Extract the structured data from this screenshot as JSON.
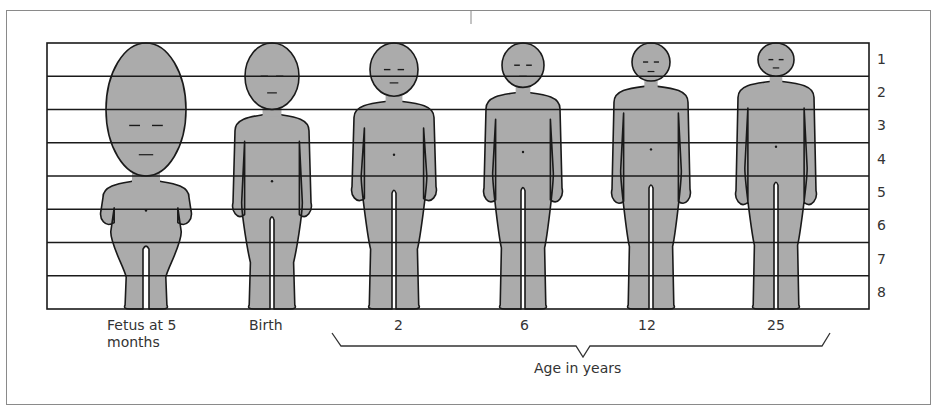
{
  "figure": {
    "grid_divisions": 8,
    "scale_labels": [
      "1",
      "2",
      "3",
      "4",
      "5",
      "6",
      "7",
      "8"
    ],
    "fill_color": "#ababab",
    "outline_color": "#1a1a1a",
    "stages": [
      {
        "id": "fetus",
        "label": "Fetus at 5",
        "label_line2": "months",
        "head_fraction": 0.5
      },
      {
        "id": "birth",
        "label": "Birth",
        "head_fraction": 0.25
      },
      {
        "id": "age2",
        "label": "2",
        "head_fraction": 0.2
      },
      {
        "id": "age6",
        "label": "6",
        "head_fraction": 0.167
      },
      {
        "id": "age12",
        "label": "12",
        "head_fraction": 0.143
      },
      {
        "id": "age25",
        "label": "25",
        "head_fraction": 0.125
      }
    ],
    "bracket_label": "Age in years"
  }
}
